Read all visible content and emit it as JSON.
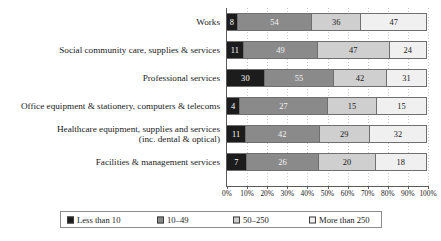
{
  "chart_data": {
    "type": "bar",
    "subtype": "stacked-bar-100-percent-horizontal",
    "title": "",
    "xlabel": "",
    "ylabel": "",
    "orientation": "horizontal",
    "stacked": true,
    "normalized_to_percent": true,
    "grid": true,
    "legend_position": "bottom",
    "xlim": [
      0,
      100
    ],
    "xticks": [
      0,
      10,
      20,
      30,
      40,
      50,
      60,
      70,
      80,
      90,
      100
    ],
    "xtick_labels": [
      "0%",
      "10%",
      "20%",
      "30%",
      "40%",
      "50%",
      "60%",
      "70%",
      "80%",
      "90%",
      "100%"
    ],
    "categories": [
      "Works",
      "Social community care, supplies & services",
      "Professional services",
      "Office equipment & stationery, computers & telecoms",
      "Healthcare equipment, supplies and services\n(inc. dental & optical)",
      "Facilities & management services"
    ],
    "series": [
      {
        "name": "Less than 10",
        "color": "#1c1c1c",
        "values": [
          8,
          11,
          30,
          4,
          11,
          7
        ]
      },
      {
        "name": "10–49",
        "color": "#8a8a8a",
        "values": [
          54,
          49,
          55,
          27,
          42,
          26
        ]
      },
      {
        "name": "50–250",
        "color": "#cfcfcf",
        "values": [
          36,
          47,
          42,
          15,
          29,
          20
        ]
      },
      {
        "name": "More than 250",
        "color": "#f0f0f0",
        "values": [
          47,
          24,
          31,
          15,
          32,
          18
        ]
      }
    ],
    "row_totals": [
      145,
      131,
      158,
      61,
      114,
      71
    ]
  },
  "legend": {
    "items": [
      {
        "label": "Less than 10"
      },
      {
        "label": "10–49"
      },
      {
        "label": "50–250"
      },
      {
        "label": "More than 250"
      }
    ]
  }
}
